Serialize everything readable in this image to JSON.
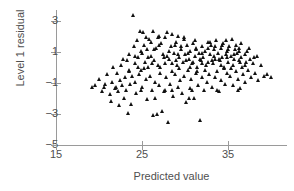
{
  "chart_data": {
    "type": "scatter",
    "title": "",
    "xlabel": "Predicted value",
    "ylabel": "Level 1 residual",
    "xlim": [
      15,
      41
    ],
    "ylim": [
      -5,
      3.8
    ],
    "xticks": [
      15,
      25,
      35
    ],
    "yticks": [
      3,
      1,
      -1,
      -3,
      -5
    ],
    "xtick_labels": [
      "15",
      "25",
      "35"
    ],
    "ytick_labels": [
      "3",
      "1",
      "−1",
      "−3",
      "−5"
    ],
    "grid": false,
    "legend": null,
    "marker": "triangle-up",
    "marker_color": "#111111",
    "axis_color": "#9a9a9a",
    "text_color": "#4f4f4f",
    "n_points": 232,
    "points": [
      [
        19.3,
        -1.25
      ],
      [
        19.6,
        -1.15
      ],
      [
        20.1,
        -0.75
      ],
      [
        20.4,
        -1.55
      ],
      [
        20.8,
        -1.05
      ],
      [
        21.0,
        -0.45
      ],
      [
        21.3,
        -1.75
      ],
      [
        21.5,
        -2.15
      ],
      [
        21.6,
        -0.95
      ],
      [
        21.9,
        -1.35
      ],
      [
        22.2,
        -0.35
      ],
      [
        22.3,
        -1.55
      ],
      [
        22.4,
        -2.45
      ],
      [
        22.5,
        -0.85
      ],
      [
        22.7,
        -1.15
      ],
      [
        22.9,
        0.55
      ],
      [
        23.0,
        -1.95
      ],
      [
        23.1,
        -0.65
      ],
      [
        23.2,
        -1.45
      ],
      [
        23.4,
        -2.95
      ],
      [
        23.5,
        -0.25
      ],
      [
        23.6,
        0.85
      ],
      [
        23.7,
        -1.05
      ],
      [
        23.8,
        -2.35
      ],
      [
        23.9,
        -0.55
      ],
      [
        24.0,
        3.4
      ],
      [
        24.1,
        1.35
      ],
      [
        24.2,
        -0.95
      ],
      [
        24.3,
        0.25
      ],
      [
        24.4,
        -1.65
      ],
      [
        24.5,
        1.75
      ],
      [
        24.6,
        0.65
      ],
      [
        24.7,
        -0.45
      ],
      [
        24.8,
        2.35
      ],
      [
        24.9,
        1.05
      ],
      [
        25.0,
        -0.15
      ],
      [
        25.1,
        0.95
      ],
      [
        25.1,
        -1.25
      ],
      [
        25.2,
        2.3
      ],
      [
        25.3,
        1.45
      ],
      [
        25.4,
        0.35
      ],
      [
        25.5,
        -0.75
      ],
      [
        25.6,
        1.15
      ],
      [
        25.7,
        -2.05
      ],
      [
        25.8,
        0.05
      ],
      [
        25.9,
        1.85
      ],
      [
        26.0,
        -0.55
      ],
      [
        26.1,
        0.75
      ],
      [
        26.2,
        -1.45
      ],
      [
        26.3,
        2.35
      ],
      [
        26.4,
        -3.05
      ],
      [
        26.5,
        0.45
      ],
      [
        26.6,
        -0.95
      ],
      [
        26.7,
        1.25
      ],
      [
        26.8,
        -3.0
      ],
      [
        26.9,
        0.15
      ],
      [
        27.0,
        -1.15
      ],
      [
        27.1,
        2.05
      ],
      [
        27.2,
        -0.35
      ],
      [
        27.3,
        1.55
      ],
      [
        27.4,
        -2.8
      ],
      [
        27.5,
        0.85
      ],
      [
        27.6,
        -1.55
      ],
      [
        27.7,
        0.25
      ],
      [
        27.8,
        1.95
      ],
      [
        27.9,
        -0.65
      ],
      [
        28.0,
        2.25
      ],
      [
        28.1,
        -3.55
      ],
      [
        28.2,
        0.55
      ],
      [
        28.3,
        -1.05
      ],
      [
        28.4,
        1.35
      ],
      [
        28.5,
        -0.25
      ],
      [
        28.6,
        2.15
      ],
      [
        28.7,
        -1.85
      ],
      [
        28.8,
        0.95
      ],
      [
        28.9,
        -0.45
      ],
      [
        29.0,
        1.65
      ],
      [
        29.1,
        0.15
      ],
      [
        29.2,
        -1.25
      ],
      [
        29.3,
        2.05
      ],
      [
        29.4,
        0.65
      ],
      [
        29.5,
        -0.85
      ],
      [
        29.6,
        1.15
      ],
      [
        29.7,
        -1.65
      ],
      [
        29.8,
        0.35
      ],
      [
        29.9,
        1.85
      ],
      [
        30.0,
        -0.55
      ],
      [
        30.1,
        0.85
      ],
      [
        30.2,
        -2.25
      ],
      [
        30.3,
        1.45
      ],
      [
        30.4,
        -0.15
      ],
      [
        30.5,
        0.55
      ],
      [
        30.6,
        -1.35
      ],
      [
        30.7,
        1.05
      ],
      [
        30.8,
        -0.75
      ],
      [
        30.9,
        0.25
      ],
      [
        31.0,
        1.55
      ],
      [
        31.1,
        -1.95
      ],
      [
        31.2,
        0.75
      ],
      [
        31.3,
        -0.35
      ],
      [
        31.4,
        1.25
      ],
      [
        31.5,
        0.05
      ],
      [
        31.6,
        -1.15
      ],
      [
        31.7,
        0.95
      ],
      [
        31.8,
        -3.4
      ],
      [
        31.9,
        0.45
      ],
      [
        32.0,
        1.35
      ],
      [
        32.1,
        -0.65
      ],
      [
        32.2,
        0.65
      ],
      [
        32.3,
        -1.45
      ],
      [
        32.4,
        1.05
      ],
      [
        32.5,
        0.15
      ],
      [
        32.6,
        -0.95
      ],
      [
        32.7,
        1.65
      ],
      [
        32.8,
        0.35
      ],
      [
        32.9,
        -0.45
      ],
      [
        33.0,
        0.85
      ],
      [
        33.1,
        1.45
      ],
      [
        33.2,
        -1.25
      ],
      [
        33.3,
        0.25
      ],
      [
        33.4,
        1.15
      ],
      [
        33.5,
        -0.65
      ],
      [
        33.6,
        0.55
      ],
      [
        33.7,
        1.75
      ],
      [
        33.8,
        -0.25
      ],
      [
        33.9,
        0.95
      ],
      [
        34.0,
        -1.55
      ],
      [
        34.1,
        0.45
      ],
      [
        34.2,
        1.25
      ],
      [
        34.3,
        -0.85
      ],
      [
        34.4,
        0.65
      ],
      [
        34.5,
        1.55
      ],
      [
        34.6,
        0.05
      ],
      [
        34.7,
        -1.05
      ],
      [
        34.8,
        0.85
      ],
      [
        34.9,
        1.05
      ],
      [
        35.0,
        -0.35
      ],
      [
        35.1,
        0.35
      ],
      [
        35.2,
        1.35
      ],
      [
        35.3,
        -0.55
      ],
      [
        35.4,
        0.75
      ],
      [
        35.5,
        1.85
      ],
      [
        35.6,
        0.15
      ],
      [
        35.7,
        -1.15
      ],
      [
        35.8,
        0.55
      ],
      [
        35.9,
        1.15
      ],
      [
        36.0,
        -0.25
      ],
      [
        36.1,
        0.95
      ],
      [
        36.2,
        -0.75
      ],
      [
        36.3,
        0.45
      ],
      [
        36.4,
        1.25
      ],
      [
        36.5,
        -1.35
      ],
      [
        36.6,
        0.65
      ],
      [
        36.7,
        0.05
      ],
      [
        36.8,
        -0.45
      ],
      [
        37.0,
        0.85
      ],
      [
        37.1,
        -0.95
      ],
      [
        37.2,
        0.35
      ],
      [
        37.3,
        1.05
      ],
      [
        37.4,
        -0.15
      ],
      [
        37.6,
        0.55
      ],
      [
        37.8,
        -0.65
      ],
      [
        38.0,
        0.25
      ],
      [
        38.2,
        -0.35
      ],
      [
        38.4,
        0.75
      ],
      [
        38.6,
        -0.85
      ],
      [
        38.9,
        0.15
      ],
      [
        39.2,
        -0.55
      ],
      [
        39.6,
        -0.45
      ],
      [
        40.1,
        -0.65
      ],
      [
        24.6,
        0.05
      ],
      [
        25.3,
        -0.05
      ],
      [
        26.1,
        1.65
      ],
      [
        26.9,
        1.95
      ],
      [
        27.6,
        0.65
      ],
      [
        28.2,
        1.05
      ],
      [
        28.9,
        1.45
      ],
      [
        29.4,
        -0.05
      ],
      [
        30.0,
        1.95
      ],
      [
        30.6,
        0.05
      ],
      [
        31.2,
        1.75
      ],
      [
        31.8,
        0.55
      ],
      [
        32.4,
        -0.15
      ],
      [
        33.0,
        1.65
      ],
      [
        33.6,
        1.35
      ],
      [
        34.2,
        0.15
      ],
      [
        34.8,
        1.75
      ],
      [
        35.4,
        -0.05
      ],
      [
        36.0,
        1.45
      ],
      [
        36.6,
        1.55
      ],
      [
        22.6,
        0.15
      ],
      [
        23.3,
        0.45
      ],
      [
        24.2,
        0.75
      ],
      [
        25.5,
        1.95
      ],
      [
        26.5,
        1.15
      ],
      [
        27.2,
        0.05
      ],
      [
        28.5,
        0.25
      ],
      [
        29.6,
        1.35
      ],
      [
        30.4,
        0.95
      ],
      [
        31.5,
        -0.25
      ],
      [
        32.1,
        0.95
      ],
      [
        32.8,
        1.25
      ],
      [
        33.4,
        0.75
      ],
      [
        34.4,
        1.45
      ],
      [
        35.1,
        1.15
      ],
      [
        35.8,
        0.85
      ],
      [
        36.3,
        1.05
      ],
      [
        37.0,
        0.15
      ],
      [
        37.5,
        1.25
      ],
      [
        38.1,
        0.65
      ],
      [
        25.8,
        0.65
      ],
      [
        26.2,
        0.25
      ],
      [
        27.0,
        1.45
      ],
      [
        28.0,
        0.75
      ],
      [
        29.0,
        0.45
      ],
      [
        30.2,
        0.45
      ],
      [
        31.0,
        0.35
      ],
      [
        32.0,
        0.25
      ],
      [
        33.2,
        0.45
      ],
      [
        34.0,
        0.55
      ],
      [
        35.0,
        0.65
      ],
      [
        36.5,
        0.35
      ],
      [
        30.9,
        -1.45
      ],
      [
        33.8,
        -1.45
      ],
      [
        36.2,
        -1.45
      ],
      [
        28.6,
        -1.45
      ],
      [
        23.6,
        -0.15
      ],
      [
        21.7,
        0.05
      ],
      [
        27.7,
        -1.45
      ],
      [
        34.6,
        -0.05
      ],
      [
        29.2,
        0.85
      ],
      [
        31.4,
        1.15
      ],
      [
        22.0,
        -1.25
      ],
      [
        20.6,
        -1.25
      ],
      [
        24.9,
        -1.45
      ],
      [
        26.6,
        -1.95
      ],
      [
        30.5,
        -1.95
      ]
    ]
  },
  "geometry": {
    "x_axis_px": {
      "x0": 56,
      "x1": 287,
      "y": 145
    },
    "y_axis_px": {
      "y0": 10,
      "y1": 146,
      "x": 56
    },
    "x_map": {
      "value0": 15,
      "px0": 56,
      "value1": 35,
      "px1": 228
    },
    "y_map": {
      "value0": -5,
      "px0": 145,
      "value1": 3,
      "px1": 21
    }
  }
}
